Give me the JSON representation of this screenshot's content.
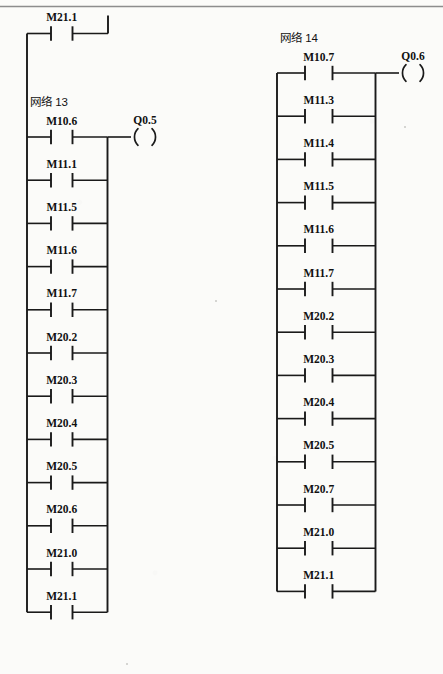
{
  "page": {
    "background_color": "#fbfbf9",
    "ink_color": "#1a1a1a",
    "rule_color": "#8d8d8d",
    "type": "plc-ladder-logic-diagram"
  },
  "top_rung": {
    "name": "top-partial-rung",
    "contact_label": "M21.1"
  },
  "networks": [
    {
      "id": "network-13",
      "title": "网络  13",
      "coil": {
        "label": "Q0.5",
        "type": "output-coil"
      },
      "contacts": [
        "M10.6",
        "M11.1",
        "M11.5",
        "M11.6",
        "M11.7",
        "M20.2",
        "M20.3",
        "M20.4",
        "M20.5",
        "M20.6",
        "M21.0",
        "M21.1"
      ]
    },
    {
      "id": "network-14",
      "title": "网络  14",
      "coil": {
        "label": "Q0.6",
        "type": "output-coil"
      },
      "contacts": [
        "M10.7",
        "M11.3",
        "M11.4",
        "M11.5",
        "M11.6",
        "M11.7",
        "M20.2",
        "M20.3",
        "M20.4",
        "M20.5",
        "M20.7",
        "M21.0",
        "M21.1"
      ]
    }
  ]
}
